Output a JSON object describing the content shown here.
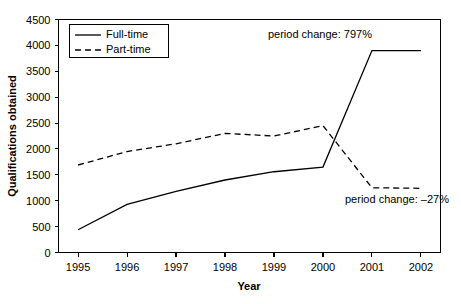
{
  "chart_data": {
    "type": "line",
    "title": "",
    "xlabel": "Year",
    "ylabel": "Qualifications obtained",
    "categories": [
      "1995",
      "1996",
      "1997",
      "1998",
      "1999",
      "2000",
      "2001",
      "2002"
    ],
    "x": [
      1995,
      1996,
      1997,
      1998,
      1999,
      2000,
      2001,
      2002
    ],
    "xlim": [
      1994.6,
      2002.4
    ],
    "ylim": [
      0,
      4500
    ],
    "ytick_values": [
      0,
      500,
      1000,
      1500,
      2000,
      2500,
      3000,
      3500,
      4000,
      4500
    ],
    "ytick_labels": [
      "0",
      "500",
      "1000",
      "1500",
      "2000",
      "2500",
      "3000",
      "3500",
      "4000",
      "4500"
    ],
    "xtick_labels": [
      "1995",
      "1996",
      "1997",
      "1998",
      "1999",
      "2000",
      "2001",
      "2002"
    ],
    "grid": false,
    "legend_position": "top-left",
    "series": [
      {
        "name": "Full-time",
        "style": "solid",
        "color": "#000000",
        "values": [
          440,
          930,
          1180,
          1400,
          1560,
          1650,
          3900,
          3900
        ]
      },
      {
        "name": "Part-time",
        "style": "dashed",
        "color": "#000000",
        "values": [
          1690,
          1950,
          2100,
          2300,
          2250,
          2450,
          1250,
          1240
        ]
      }
    ],
    "annotations": [
      {
        "id": "full-time-period-change",
        "text": "period change: 797%",
        "x": 2001,
        "y": 4150,
        "anchor": "end"
      },
      {
        "id": "part-time-period-change",
        "text": "period change: –27%",
        "x": 2000.45,
        "y": 960,
        "anchor": "start"
      }
    ]
  },
  "legend": {
    "items": [
      {
        "label": "Full-time",
        "style": "solid"
      },
      {
        "label": "Part-time",
        "style": "dashed"
      }
    ]
  },
  "axes": {
    "y_title": "Qualifications obtained",
    "x_title": "Year"
  }
}
